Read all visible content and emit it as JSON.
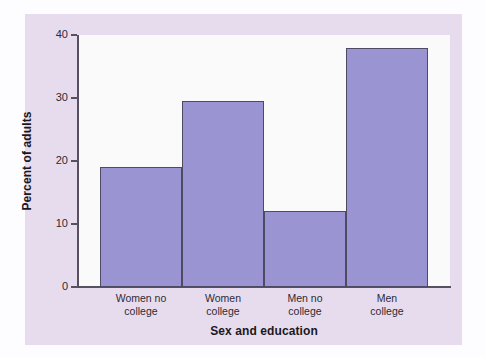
{
  "chart_data": {
    "type": "bar",
    "title": "",
    "xlabel": "Sex and education",
    "ylabel": "Percent of adults",
    "categories": [
      "Women no college",
      "Women college",
      "Men no college",
      "Men college"
    ],
    "category_lines": [
      [
        "Women no",
        "college"
      ],
      [
        "Women",
        "college"
      ],
      [
        "Men no",
        "college"
      ],
      [
        "Men",
        "college"
      ]
    ],
    "values": [
      19.0,
      29.5,
      12.1,
      38.0
    ],
    "ylim": [
      0,
      40
    ],
    "yticks": [
      0,
      10,
      20,
      30,
      40
    ],
    "ytick_labels": [
      "0",
      "10",
      "20",
      "30",
      "40"
    ],
    "grid": false,
    "legend": false,
    "bar_gap": 0,
    "colors": {
      "bar_fill": "#9a94d2",
      "bar_border": "#4f4a63",
      "plot_background": "#fbfafb",
      "panel_background": "#e7dcee",
      "figure_background": "#fdfcfe",
      "axis_line": "#565061",
      "text": "#2d2a33",
      "title_text": "#1b1820"
    }
  }
}
